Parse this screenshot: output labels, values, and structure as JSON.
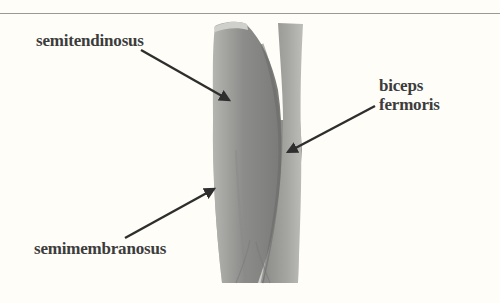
{
  "figure": {
    "labels": [
      {
        "id": "semitendinosus",
        "text": "semitendinosus"
      },
      {
        "id": "biceps-femoris",
        "lines": [
          "biceps",
          "fermoris"
        ]
      },
      {
        "id": "semimembranosus",
        "text": "semimembranosus"
      }
    ]
  },
  "colors": {
    "background": "#fefdf8",
    "rule": "#9a9a94",
    "label_text": "#3c3c3c",
    "arrow": "#2e2e2e",
    "muscle_dark": "#6e6e6e",
    "muscle_mid": "#9a9a9a",
    "muscle_light": "#c8c8c4"
  }
}
